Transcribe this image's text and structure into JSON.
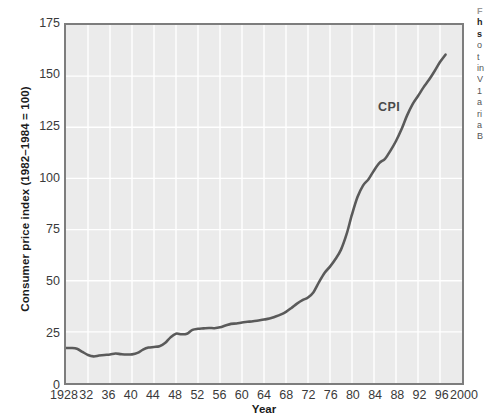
{
  "chart_data": {
    "type": "line",
    "title": "",
    "xlabel": "Year",
    "ylabel": "Consumer price index (1982–1984 = 100)",
    "xlim": [
      1928,
      2000
    ],
    "ylim": [
      0,
      175
    ],
    "grid": true,
    "legend_position": "inline-annotation",
    "annotations": [
      {
        "text": "CPI",
        "x": 1986,
        "y": 131
      }
    ],
    "xticks": [
      1928,
      1932,
      1936,
      1940,
      1944,
      1948,
      1952,
      1956,
      1960,
      1964,
      1968,
      1972,
      1976,
      1980,
      1984,
      1988,
      1992,
      1996,
      2000
    ],
    "xtick_labels": [
      "1928",
      "32",
      "36",
      "40",
      "44",
      "48",
      "52",
      "56",
      "60",
      "64",
      "68",
      "72",
      "76",
      "80",
      "84",
      "88",
      "92",
      "96",
      "2000"
    ],
    "yticks": [
      0,
      25,
      50,
      75,
      100,
      125,
      150,
      175
    ],
    "ytick_labels": [
      "0",
      "25",
      "50",
      "75",
      "100",
      "125",
      "150",
      "175"
    ],
    "series": [
      {
        "name": "CPI",
        "color": "#5a5a5a",
        "x": [
          1928,
          1929,
          1930,
          1931,
          1932,
          1933,
          1934,
          1935,
          1936,
          1937,
          1938,
          1939,
          1940,
          1941,
          1942,
          1943,
          1944,
          1945,
          1946,
          1947,
          1948,
          1949,
          1950,
          1951,
          1952,
          1953,
          1954,
          1955,
          1956,
          1957,
          1958,
          1959,
          1960,
          1961,
          1962,
          1963,
          1964,
          1965,
          1966,
          1967,
          1968,
          1969,
          1970,
          1971,
          1972,
          1973,
          1974,
          1975,
          1976,
          1977,
          1978,
          1979,
          1980,
          1981,
          1982,
          1983,
          1984,
          1985,
          1986,
          1987,
          1988,
          1989,
          1990,
          1991,
          1992,
          1993,
          1994,
          1995,
          1996,
          1997
        ],
        "y": [
          17.1,
          17.1,
          16.7,
          15.2,
          13.7,
          13.0,
          13.4,
          13.7,
          13.9,
          14.4,
          14.1,
          13.9,
          14.0,
          14.7,
          16.3,
          17.3,
          17.6,
          18.0,
          19.5,
          22.3,
          24.1,
          23.8,
          24.1,
          26.0,
          26.5,
          26.7,
          26.9,
          26.8,
          27.2,
          28.1,
          28.9,
          29.1,
          29.6,
          29.9,
          30.2,
          30.6,
          31.0,
          31.5,
          32.4,
          33.4,
          34.8,
          36.7,
          38.8,
          40.5,
          41.8,
          44.4,
          49.3,
          53.8,
          56.9,
          60.6,
          65.2,
          72.6,
          82.4,
          90.9,
          96.5,
          99.6,
          103.9,
          107.6,
          109.6,
          113.6,
          118.3,
          124.0,
          130.7,
          136.2,
          140.3,
          144.5,
          148.2,
          152.4,
          156.9,
          160.5
        ]
      }
    ]
  },
  "axes": {
    "y_title": "Consumer price index (1982–1984 = 100)",
    "x_title": "Year"
  },
  "caption_column": {
    "lines": [
      "F",
      "h",
      "s",
      "o",
      "t",
      "in",
      "V",
      "1",
      "a",
      "ri",
      "a",
      "B",
      "-"
    ]
  }
}
